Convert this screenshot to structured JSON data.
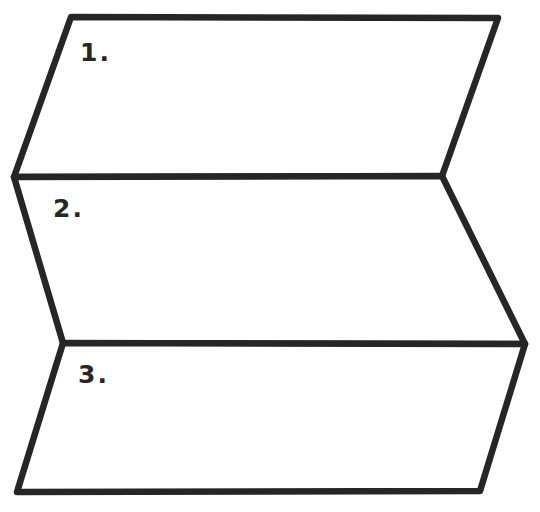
{
  "diagram": {
    "type": "folded-strip-template",
    "colors": {
      "background": "#ffffff",
      "stroke": "#262626",
      "text": "#262626"
    },
    "panels": [
      {
        "label": "1.",
        "points": "71,17 498,18 442,176 14,177",
        "label_pos": {
          "x": 80,
          "y": 40
        }
      },
      {
        "label": "2.",
        "points": "14,177 442,176 525,344 63,343",
        "label_pos": {
          "x": 53,
          "y": 196
        }
      },
      {
        "label": "3.",
        "points": "63,343 525,344 480,491 17,492",
        "label_pos": {
          "x": 78,
          "y": 362
        }
      }
    ]
  }
}
